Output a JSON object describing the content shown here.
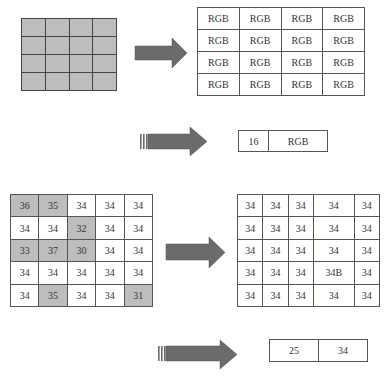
{
  "colors": {
    "cell_shade": "#bdbdbd",
    "arrow": "#6b6b6b",
    "border": "#555555"
  },
  "rgb_grid": {
    "rows": [
      [
        "RGB",
        "RGB",
        "RGB",
        "RGB"
      ],
      [
        "RGB",
        "RGB",
        "RGB",
        "RGB"
      ],
      [
        "RGB",
        "RGB",
        "RGB",
        "RGB"
      ],
      [
        "RGB",
        "RGB",
        "RGB",
        "RGB"
      ]
    ]
  },
  "palette_result_1": {
    "cells": [
      "16",
      "RGB"
    ]
  },
  "value_grid": {
    "rows": [
      [
        "36",
        "35",
        "34",
        "34",
        "34"
      ],
      [
        "34",
        "34",
        "32",
        "34",
        "34"
      ],
      [
        "33",
        "37",
        "30",
        "34",
        "34"
      ],
      [
        "34",
        "34",
        "34",
        "34",
        "34"
      ],
      [
        "34",
        "35",
        "34",
        "34",
        "31"
      ]
    ],
    "shaded": [
      [
        0,
        0
      ],
      [
        0,
        1
      ],
      [
        1,
        2
      ],
      [
        2,
        0
      ],
      [
        2,
        1
      ],
      [
        2,
        2
      ],
      [
        4,
        1
      ],
      [
        4,
        4
      ]
    ]
  },
  "output_grid": {
    "rows": [
      [
        "34",
        "34",
        "34",
        "34",
        "34"
      ],
      [
        "34",
        "34",
        "34",
        "34",
        "34"
      ],
      [
        "34",
        "34",
        "34",
        "34",
        "34"
      ],
      [
        "34",
        "34",
        "34",
        "34B",
        "34"
      ],
      [
        "34",
        "34",
        "34",
        "34",
        "34"
      ]
    ]
  },
  "palette_result_2": {
    "cells": [
      "25",
      "34"
    ]
  }
}
